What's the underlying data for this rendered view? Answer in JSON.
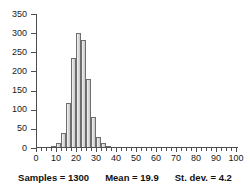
{
  "chart_data": {
    "type": "bar",
    "title": "",
    "subtitle": "",
    "xlabel": "",
    "ylabel": "",
    "xlim": [
      0,
      100
    ],
    "ylim": [
      0,
      350
    ],
    "grid": false,
    "legend": null,
    "bin_width": 2.5,
    "orientation": "vertical",
    "bar_color": "#d6d6d6",
    "bar_edge_color": "#6e6e6e",
    "x_tick_labels": [
      "0",
      "10",
      "20",
      "30",
      "40",
      "50",
      "60",
      "70",
      "80",
      "90",
      "100"
    ],
    "x_tick_values": [
      0,
      10,
      20,
      30,
      40,
      50,
      60,
      70,
      80,
      90,
      100
    ],
    "x_minor_tick_step": 2.5,
    "y_tick_labels": [
      "0",
      "50",
      "100",
      "150",
      "200",
      "250",
      "300",
      "350"
    ],
    "y_tick_values": [
      0,
      50,
      100,
      150,
      200,
      250,
      300,
      350
    ],
    "categories": [
      7.5,
      10,
      12.5,
      15,
      17.5,
      20,
      22.5,
      25,
      27.5,
      30,
      32.5,
      35
    ],
    "values": [
      5,
      12,
      40,
      118,
      235,
      300,
      283,
      181,
      82,
      30,
      12,
      5
    ],
    "bins": [
      {
        "left": 7.5,
        "right": 10,
        "count": 5
      },
      {
        "left": 10,
        "right": 12.5,
        "count": 12
      },
      {
        "left": 12.5,
        "right": 15,
        "count": 40
      },
      {
        "left": 15,
        "right": 17.5,
        "count": 118
      },
      {
        "left": 17.5,
        "right": 20,
        "count": 235
      },
      {
        "left": 20,
        "right": 22.5,
        "count": 300
      },
      {
        "left": 22.5,
        "right": 25,
        "count": 283
      },
      {
        "left": 25,
        "right": 27.5,
        "count": 181
      },
      {
        "left": 27.5,
        "right": 30,
        "count": 82
      },
      {
        "left": 30,
        "right": 32.5,
        "count": 30
      },
      {
        "left": 32.5,
        "right": 35,
        "count": 12
      },
      {
        "left": 35,
        "right": 37.5,
        "count": 5
      }
    ]
  },
  "stats": {
    "samples_label": "Samples = 1300",
    "mean_label": "Mean = 19.9",
    "stdev_label": "St. dev. = 4.2",
    "samples_value": 1300,
    "mean_value": 19.9,
    "stdev_value": 4.2
  }
}
